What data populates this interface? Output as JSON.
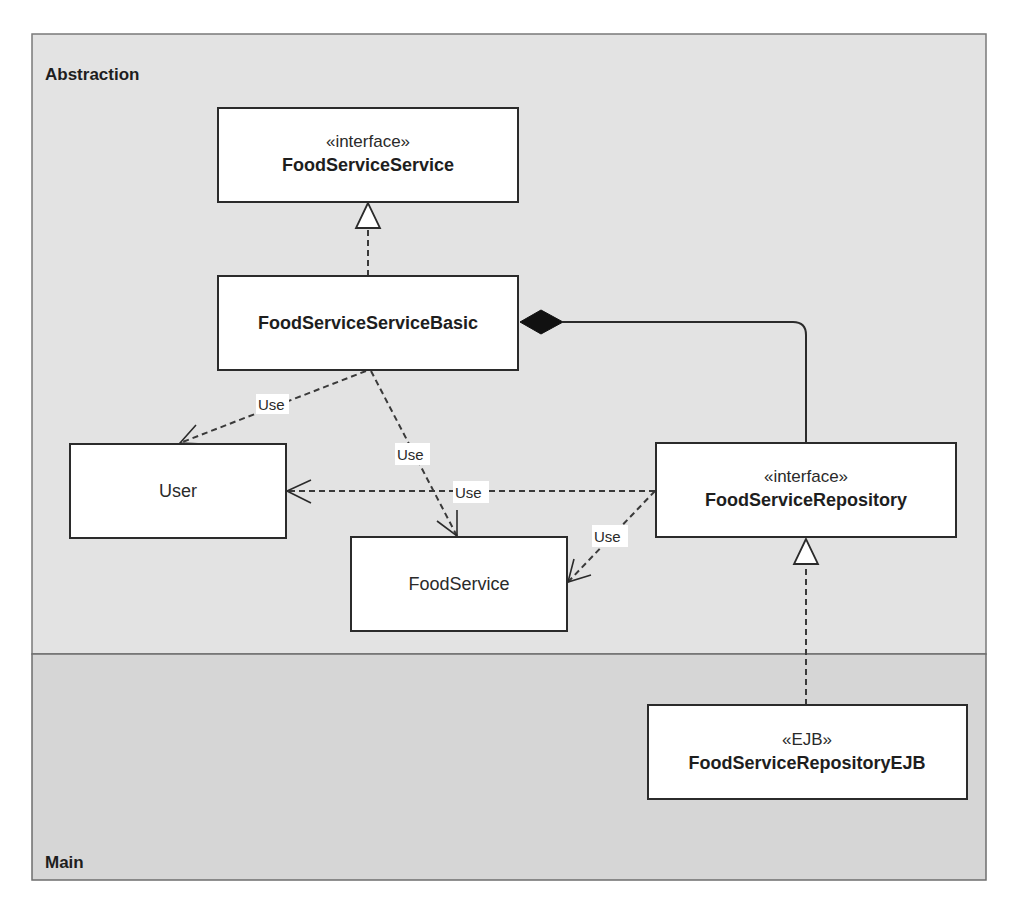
{
  "packages": {
    "abstraction": {
      "label": "Abstraction",
      "fill": "#e3e3e3"
    },
    "main": {
      "label": "Main",
      "fill": "#d6d6d6"
    }
  },
  "classes": {
    "food_service_service": {
      "stereotype": "«interface»",
      "name": "FoodServiceService"
    },
    "food_service_service_basic": {
      "name": "FoodServiceServiceBasic"
    },
    "user": {
      "name": "User"
    },
    "food_service": {
      "name": "FoodService"
    },
    "food_service_repository": {
      "stereotype": "«interface»",
      "name": "FoodServiceRepository"
    },
    "food_service_repository_ejb": {
      "stereotype": "«EJB»",
      "name": "FoodServiceRepositoryEJB"
    }
  },
  "relationships": {
    "basic_realizes_service": {
      "type": "realization",
      "from": "FoodServiceServiceBasic",
      "to": "FoodServiceService"
    },
    "basic_composes_repository": {
      "type": "composition",
      "whole": "FoodServiceServiceBasic",
      "part": "FoodServiceRepository"
    },
    "basic_uses_user": {
      "type": "dependency",
      "label": "Use",
      "from": "FoodServiceServiceBasic",
      "to": "User"
    },
    "basic_uses_foodservice": {
      "type": "dependency",
      "label": "Use",
      "from": "FoodServiceServiceBasic",
      "to": "FoodService"
    },
    "repo_uses_user": {
      "type": "dependency",
      "label": "Use",
      "from": "FoodServiceRepository",
      "to": "User"
    },
    "repo_uses_foodservice": {
      "type": "dependency",
      "label": "Use",
      "from": "FoodServiceRepository",
      "to": "FoodService"
    },
    "ejb_realizes_repository": {
      "type": "realization",
      "from": "FoodServiceRepositoryEJB",
      "to": "FoodServiceRepository"
    }
  }
}
